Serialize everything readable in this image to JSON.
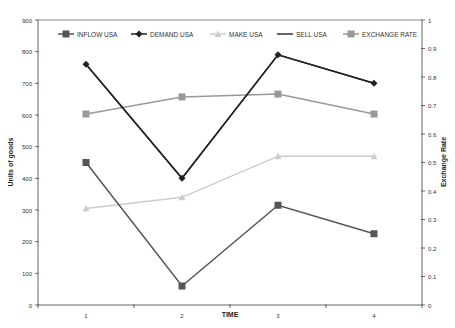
{
  "chart_data": {
    "type": "line",
    "title": "",
    "xlabel": "TIME",
    "ylabel": "Units of goods",
    "y2label": "Exchange Rate",
    "categories": [
      "1",
      "2",
      "3",
      "4"
    ],
    "ylim": [
      0,
      900
    ],
    "y2lim": [
      0,
      1
    ],
    "yticks": [
      0,
      100,
      200,
      300,
      400,
      500,
      600,
      700,
      800,
      900
    ],
    "y2ticks": [
      "0",
      "0.1",
      "0.2",
      "0.3",
      "0.4",
      "0.5",
      "0.6",
      "0.7",
      "0.8",
      "0.9",
      "1"
    ],
    "grid": false,
    "legend_position": "top-inside",
    "series": [
      {
        "name": "INFLOW USA",
        "axis": "left",
        "values": [
          450,
          60,
          315,
          225
        ],
        "color": "#555555",
        "marker": "square"
      },
      {
        "name": "DEMAND USA",
        "axis": "left",
        "values": [
          760,
          400,
          790,
          700
        ],
        "color": "#222222",
        "marker": "diamond"
      },
      {
        "name": "MAKE USA",
        "axis": "left",
        "values": [
          305,
          340,
          470,
          470
        ],
        "color": "#cccccc",
        "marker": "triangle"
      },
      {
        "name": "SELL USA",
        "axis": "left",
        "values": [
          760,
          400,
          790,
          700
        ],
        "color": "#333333",
        "marker": "none"
      },
      {
        "name": "EXCHANGE RATE",
        "axis": "right",
        "values": [
          0.67,
          0.73,
          0.74,
          0.67
        ],
        "color": "#999999",
        "marker": "square"
      }
    ]
  }
}
